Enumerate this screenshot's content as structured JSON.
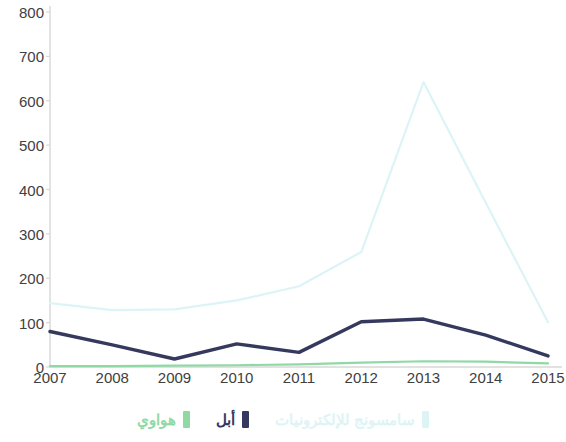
{
  "chart_data": {
    "type": "line",
    "title": "",
    "subtitle": "",
    "xlabel": "",
    "ylabel": "",
    "categories": [
      "2007",
      "2008",
      "2009",
      "2010",
      "2011",
      "2012",
      "2013",
      "2014",
      "2015"
    ],
    "x": [
      2007,
      2008,
      2009,
      2010,
      2011,
      2012,
      2013,
      2014,
      2015
    ],
    "xlim": [
      2007,
      2015
    ],
    "ylim": [
      0,
      800
    ],
    "ytick_labels": [
      "0",
      "100",
      "200",
      "300",
      "400",
      "500",
      "600",
      "700",
      "800"
    ],
    "ytick_values": [
      0,
      100,
      200,
      300,
      400,
      500,
      600,
      700,
      800
    ],
    "grid": false,
    "legend_position": "bottom",
    "series": [
      {
        "name": "سامسونج للإلكترونيات",
        "color": "#ddf4f7",
        "values": [
          144,
          128,
          130,
          150,
          182,
          259,
          642,
          370,
          101
        ]
      },
      {
        "name": "أبل",
        "color": "#36395e",
        "values": [
          80,
          50,
          18,
          52,
          33,
          102,
          108,
          72,
          25
        ]
      },
      {
        "name": "هواوي",
        "color": "#8fd9a4",
        "values": [
          2,
          2,
          3,
          4,
          6,
          10,
          13,
          12,
          8
        ]
      }
    ]
  },
  "axis": {
    "line_color": "#d8d8d8",
    "tick_color": "#404040"
  },
  "legend": {
    "items": [
      {
        "label": "سامسونج للإلكترونيات",
        "color": "#ddf4f7"
      },
      {
        "label": "أبل",
        "color": "#36395e"
      },
      {
        "label": "هواوي",
        "color": "#8fd9a4"
      }
    ]
  }
}
